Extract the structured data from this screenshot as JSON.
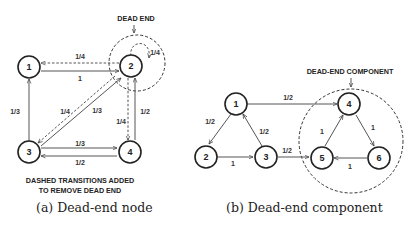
{
  "figure_a": {
    "caption": "(a) Dead-end node",
    "top_label": "DEAD END",
    "bottom_note_line1": "DASHED TRANSITIONS ADDED",
    "bottom_note_line2": "TO REMOVE DEAD END",
    "nodes": [
      {
        "id": "1",
        "label": "1"
      },
      {
        "id": "2",
        "label": "2"
      },
      {
        "id": "3",
        "label": "3"
      },
      {
        "id": "4",
        "label": "4"
      }
    ],
    "edges": [
      {
        "from": "1",
        "to": "2",
        "label": "1",
        "style": "solid"
      },
      {
        "from": "2",
        "to": "1",
        "label": "1/4",
        "style": "dashed"
      },
      {
        "from": "2",
        "to": "2",
        "label": "1/4",
        "style": "dashed"
      },
      {
        "from": "2",
        "to": "3",
        "label": "1/4",
        "style": "dashed"
      },
      {
        "from": "2",
        "to": "4",
        "label": "1/4",
        "style": "dashed"
      },
      {
        "from": "3",
        "to": "1",
        "label": "1/3",
        "style": "solid"
      },
      {
        "from": "3",
        "to": "2",
        "label": "1/3",
        "style": "solid"
      },
      {
        "from": "3",
        "to": "4",
        "label": "1/3",
        "style": "solid"
      },
      {
        "from": "4",
        "to": "2",
        "label": "1/2",
        "style": "solid"
      },
      {
        "from": "4",
        "to": "3",
        "label": "1/2",
        "style": "solid"
      }
    ]
  },
  "figure_b": {
    "caption": "(b) Dead-end component",
    "top_label": "DEAD-END COMPONENT",
    "nodes": [
      {
        "id": "1",
        "label": "1"
      },
      {
        "id": "2",
        "label": "2"
      },
      {
        "id": "3",
        "label": "3"
      },
      {
        "id": "4",
        "label": "4"
      },
      {
        "id": "5",
        "label": "5"
      },
      {
        "id": "6",
        "label": "6"
      }
    ],
    "edges": [
      {
        "from": "1",
        "to": "4",
        "label": "1/2",
        "style": "solid"
      },
      {
        "from": "1",
        "to": "2",
        "label": "1/2",
        "style": "solid"
      },
      {
        "from": "2",
        "to": "3",
        "label": "1",
        "style": "solid"
      },
      {
        "from": "3",
        "to": "1",
        "label": "1/2",
        "style": "solid"
      },
      {
        "from": "3",
        "to": "5",
        "label": "1/2",
        "style": "solid"
      },
      {
        "from": "5",
        "to": "4",
        "label": "1",
        "style": "solid"
      },
      {
        "from": "4",
        "to": "6",
        "label": "1",
        "style": "solid"
      },
      {
        "from": "6",
        "to": "5",
        "label": "1",
        "style": "solid"
      }
    ]
  }
}
